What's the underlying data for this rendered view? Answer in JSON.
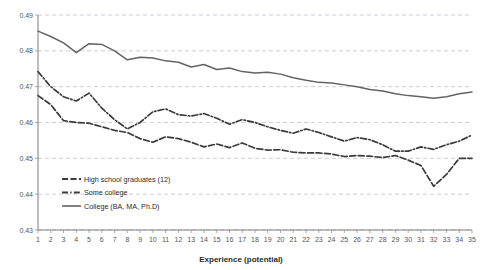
{
  "chart_data": {
    "type": "line",
    "title": "",
    "xlabel": "Experience (potential)",
    "ylabel": "",
    "xlim": [
      1,
      35
    ],
    "ylim": [
      0.43,
      0.49
    ],
    "ytick_labels": [
      "0.49",
      "0.48",
      "0.47",
      "0.46",
      "0.45",
      "0.44",
      "0.43"
    ],
    "ytick_values": [
      0.49,
      0.48,
      0.47,
      0.46,
      0.45,
      0.44,
      0.43
    ],
    "grid": true,
    "legend_position": "inside-bottom-left",
    "x": [
      1,
      2,
      3,
      4,
      5,
      6,
      7,
      8,
      9,
      10,
      11,
      12,
      13,
      14,
      15,
      16,
      17,
      18,
      19,
      20,
      21,
      22,
      23,
      24,
      25,
      26,
      27,
      28,
      29,
      30,
      31,
      32,
      33,
      34,
      35
    ],
    "xtick_labels": [
      "1",
      "2",
      "3",
      "4",
      "5",
      "6",
      "7",
      "8",
      "9",
      "10",
      "11",
      "12",
      "13",
      "14",
      "15",
      "16",
      "17",
      "18",
      "19",
      "20",
      "21",
      "22",
      "23",
      "24",
      "25",
      "26",
      "27",
      "28",
      "29",
      "30",
      "31",
      "32",
      "33",
      "34",
      "35"
    ],
    "series": [
      {
        "name": "High school graduates (12)",
        "style": "dashed",
        "color": "#3b3b3b",
        "values": [
          0.4675,
          0.465,
          0.4605,
          0.46,
          0.4598,
          0.4588,
          0.4578,
          0.4572,
          0.4555,
          0.4545,
          0.456,
          0.4555,
          0.4545,
          0.4532,
          0.454,
          0.453,
          0.4543,
          0.4528,
          0.4523,
          0.4524,
          0.4517,
          0.4515,
          0.4515,
          0.4512,
          0.4505,
          0.4508,
          0.4506,
          0.4502,
          0.4508,
          0.4495,
          0.448,
          0.4422,
          0.4455,
          0.45,
          0.45
        ]
      },
      {
        "name": "Some college",
        "style": "dash-dot",
        "color": "#3b3b3b",
        "values": [
          0.4742,
          0.47,
          0.4672,
          0.466,
          0.4682,
          0.464,
          0.4608,
          0.4582,
          0.46,
          0.463,
          0.4638,
          0.4622,
          0.4618,
          0.4625,
          0.4612,
          0.4595,
          0.4608,
          0.46,
          0.4588,
          0.4578,
          0.457,
          0.4582,
          0.4572,
          0.456,
          0.4548,
          0.4558,
          0.4552,
          0.4538,
          0.452,
          0.452,
          0.4532,
          0.4525,
          0.4538,
          0.4548,
          0.4565
        ]
      },
      {
        "name": "College (BA, MA, Ph.D)",
        "style": "solid",
        "color": "#636363",
        "values": [
          0.4855,
          0.484,
          0.4822,
          0.4795,
          0.482,
          0.4818,
          0.48,
          0.4775,
          0.4782,
          0.478,
          0.4772,
          0.4768,
          0.4755,
          0.4762,
          0.4748,
          0.4752,
          0.4742,
          0.4738,
          0.474,
          0.4735,
          0.4725,
          0.4718,
          0.4712,
          0.471,
          0.4705,
          0.47,
          0.4692,
          0.4688,
          0.468,
          0.4675,
          0.4672,
          0.4668,
          0.4672,
          0.468,
          0.4685
        ]
      }
    ]
  },
  "legend": {
    "items": [
      {
        "label": "High school graduates (12)"
      },
      {
        "label": "Some college"
      },
      {
        "label": "College (BA, MA, Ph.D)"
      }
    ]
  }
}
